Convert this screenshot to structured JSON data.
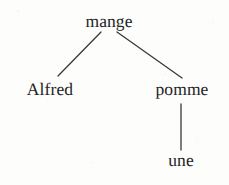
{
  "figure": {
    "kind": "syntax-tree",
    "language": "French",
    "sentence": "Alfred mange une pomme",
    "background_color": "#fdfdfc",
    "line_color": "#3a3a3a",
    "text_color": "#242424"
  },
  "nodes": {
    "root": {
      "label": "mange",
      "x": 109,
      "y": 13
    },
    "left": {
      "label": "Alfred",
      "x": 50,
      "y": 81
    },
    "right": {
      "label": "pomme",
      "x": 182,
      "y": 81
    },
    "leaf": {
      "label": "une",
      "x": 181,
      "y": 152
    }
  },
  "edges": [
    {
      "name": "root-to-alfred",
      "x1": 101,
      "y1": 32,
      "x2": 58,
      "y2": 76
    },
    {
      "name": "root-to-pomme",
      "x1": 117,
      "y1": 32,
      "x2": 182,
      "y2": 78
    },
    {
      "name": "pomme-to-une",
      "x1": 181,
      "y1": 104,
      "x2": 181,
      "y2": 150
    }
  ]
}
